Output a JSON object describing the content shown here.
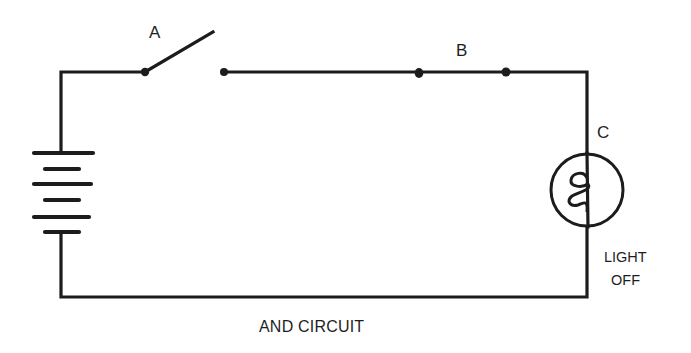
{
  "diagram": {
    "title": "AND CIRCUIT",
    "components": {
      "switch": {
        "label": "A",
        "state": "open"
      },
      "contacts": {
        "label": "B"
      },
      "lamp": {
        "label": "C",
        "status_line1": "LIGHT",
        "status_line2": "OFF"
      },
      "battery": {
        "cells": 3
      }
    },
    "colors": {
      "ink": "#1c1c1c",
      "background": "#ffffff"
    }
  }
}
